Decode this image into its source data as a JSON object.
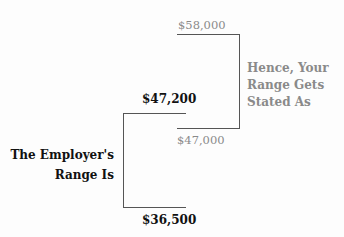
{
  "employer_range": {
    "label_line1": "The Employer's",
    "label_line2": "Range Is",
    "high": "$47,200",
    "low": "$36,500"
  },
  "your_range": {
    "label_line1": "Hence, Your",
    "label_line2": "Range Gets",
    "label_line3": "Stated As",
    "high": "$58,000",
    "low": "$47,000"
  },
  "colors": {
    "employer_text": "#111111",
    "your_text": "#8a8a8a",
    "lines": "#555555"
  }
}
